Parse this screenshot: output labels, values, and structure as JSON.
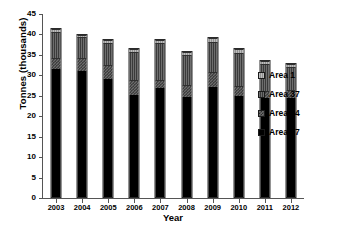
{
  "chart_data": {
    "type": "bar",
    "stacked": true,
    "title": "",
    "xlabel": "Year",
    "ylabel": "Tonnes (thousands)",
    "categories": [
      "2003",
      "2004",
      "2005",
      "2006",
      "2007",
      "2008",
      "2009",
      "2010",
      "2011",
      "2012"
    ],
    "ylim": [
      0,
      45
    ],
    "yticks": [
      0,
      5,
      10,
      15,
      20,
      25,
      30,
      35,
      40,
      45
    ],
    "grid": false,
    "legend_position": "right",
    "series": [
      {
        "name": "Area 27",
        "color": "#000000",
        "values": [
          31.7,
          31.2,
          29.3,
          25.2,
          27.0,
          24.8,
          27.2,
          25.1,
          24.6,
          24.5
        ]
      },
      {
        "name": "Area 34",
        "color": "#6d6d6d",
        "values": [
          2.8,
          3.1,
          3.5,
          3.8,
          2.1,
          3.0,
          3.7,
          2.5,
          1.7,
          2.1
        ]
      },
      {
        "name": "Area 37",
        "color": "#4f4f4f",
        "values": [
          6.4,
          5.3,
          5.3,
          7.0,
          9.0,
          7.3,
          7.5,
          8.2,
          6.8,
          5.6
        ]
      },
      {
        "name": "Area 1",
        "color": "#a8a8a8",
        "values": [
          0.6,
          0.6,
          0.7,
          0.8,
          0.9,
          0.9,
          0.9,
          1.0,
          0.7,
          0.8
        ]
      }
    ],
    "totals": [
      41.5,
      40.2,
      38.8,
      36.8,
      39.0,
      36.0,
      39.3,
      36.8,
      33.8,
      33.0
    ]
  },
  "legend": {
    "items": [
      {
        "label": "Area 1"
      },
      {
        "label": "Area 37"
      },
      {
        "label": "Area 34"
      },
      {
        "label": "Area 27"
      }
    ]
  }
}
